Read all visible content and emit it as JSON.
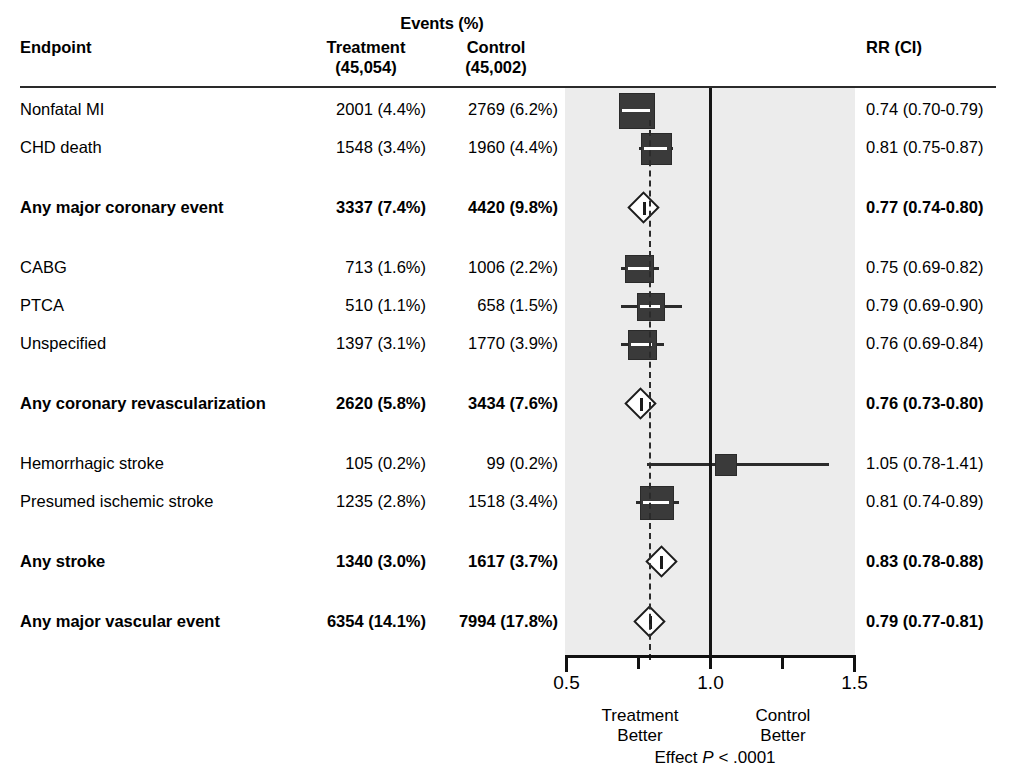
{
  "header": {
    "events_title": "Events (%)",
    "endpoint": "Endpoint",
    "treatment": "Treatment",
    "treatment_n": "(45,054)",
    "control": "Control",
    "control_n": "(45,002)",
    "rr_ci": "RR (CI)"
  },
  "axis": {
    "ticks": [
      "0.5",
      "1.0",
      "1.5"
    ],
    "min": 0.5,
    "max": 1.5,
    "null_value": 1.0,
    "reference_value": 0.79,
    "left_caption_line1": "Treatment",
    "left_caption_line2": "Better",
    "right_caption_line1": "Control",
    "right_caption_line2": "Better",
    "effect_p_pre": "Effect ",
    "effect_p_var": "P",
    "effect_p_post": " < .0001"
  },
  "colors": {
    "plot_background": "#ececec",
    "marker": "#3a3a3a",
    "line": "#1c1c1c",
    "text": "#000000"
  },
  "chart_data": {
    "type": "forest",
    "title": "Events (%)",
    "xlabel": "",
    "ylabel": "",
    "xlim": [
      0.5,
      1.5
    ],
    "x_ticks": [
      0.5,
      1.0,
      1.5
    ],
    "null_line": 1.0,
    "reference_line": 0.79,
    "grid": false,
    "legend": "none",
    "columns": [
      "Endpoint",
      "Treatment (45,054)",
      "Control (45,002)",
      "RR (CI)"
    ],
    "rows": [
      {
        "label": "Nonfatal MI",
        "treatment": "2001 (4.4%)",
        "control": "2769 (6.2%)",
        "rr_text": "0.74 (0.70-0.79)",
        "rr": 0.74,
        "ci_low": 0.7,
        "ci_high": 0.79,
        "marker": "box",
        "weight": 1.0,
        "bold": false,
        "gap_before": 0
      },
      {
        "label": "CHD death",
        "treatment": "1548 (3.4%)",
        "control": "1960 (4.4%)",
        "rr_text": "0.81 (0.75-0.87)",
        "rr": 0.81,
        "ci_low": 0.75,
        "ci_high": 0.87,
        "marker": "box",
        "weight": 0.78,
        "bold": false,
        "gap_before": 0
      },
      {
        "label": "Any major coronary event",
        "treatment": "3337 (7.4%)",
        "control": "4420 (9.8%)",
        "rr_text": "0.77 (0.74-0.80)",
        "rr": 0.77,
        "ci_low": 0.74,
        "ci_high": 0.8,
        "marker": "diamond",
        "weight": 1.0,
        "bold": true,
        "gap_before": 1
      },
      {
        "label": "CABG",
        "treatment": "713 (1.6%)",
        "control": "1006 (2.2%)",
        "rr_text": "0.75 (0.69-0.82)",
        "rr": 0.75,
        "ci_low": 0.69,
        "ci_high": 0.82,
        "marker": "box",
        "weight": 0.65,
        "bold": false,
        "gap_before": 1
      },
      {
        "label": "PTCA",
        "treatment": "510 (1.1%)",
        "control": "658 (1.5%)",
        "rr_text": "0.79 (0.69-0.90)",
        "rr": 0.79,
        "ci_low": 0.69,
        "ci_high": 0.9,
        "marker": "box",
        "weight": 0.6,
        "bold": false,
        "gap_before": 0
      },
      {
        "label": "Unspecified",
        "treatment": "1397 (3.1%)",
        "control": "1770 (3.9%)",
        "rr_text": "0.76 (0.69-0.84)",
        "rr": 0.76,
        "ci_low": 0.69,
        "ci_high": 0.84,
        "marker": "box",
        "weight": 0.7,
        "bold": false,
        "gap_before": 0
      },
      {
        "label": "Any coronary revascularization",
        "treatment": "2620 (5.8%)",
        "control": "3434 (7.6%)",
        "rr_text": "0.76 (0.73-0.80)",
        "rr": 0.76,
        "ci_low": 0.73,
        "ci_high": 0.8,
        "marker": "diamond",
        "weight": 1.0,
        "bold": true,
        "gap_before": 1
      },
      {
        "label": "Hemorrhagic stroke",
        "treatment": "105 (0.2%)",
        "control": "99 (0.2%)",
        "rr_text": "1.05 (0.78-1.41)",
        "rr": 1.05,
        "ci_low": 0.78,
        "ci_high": 1.41,
        "marker": "box",
        "weight": 0.3,
        "bold": false,
        "gap_before": 1
      },
      {
        "label": "Presumed ischemic stroke",
        "treatment": "1235 (2.8%)",
        "control": "1518 (3.4%)",
        "rr_text": "0.81 (0.74-0.89)",
        "rr": 0.81,
        "ci_low": 0.74,
        "ci_high": 0.89,
        "marker": "box",
        "weight": 0.88,
        "bold": false,
        "gap_before": 0
      },
      {
        "label": "Any stroke",
        "treatment": "1340 (3.0%)",
        "control": "1617 (3.7%)",
        "rr_text": "0.83 (0.78-0.88)",
        "rr": 0.83,
        "ci_low": 0.78,
        "ci_high": 0.88,
        "marker": "diamond",
        "weight": 1.0,
        "bold": true,
        "gap_before": 1
      },
      {
        "label": "Any major vascular event",
        "treatment": "6354 (14.1%)",
        "control": "7994 (17.8%)",
        "rr_text": "0.79 (0.77-0.81)",
        "rr": 0.79,
        "ci_low": 0.77,
        "ci_high": 0.81,
        "marker": "diamond",
        "weight": 1.0,
        "bold": true,
        "gap_before": 1
      }
    ]
  }
}
